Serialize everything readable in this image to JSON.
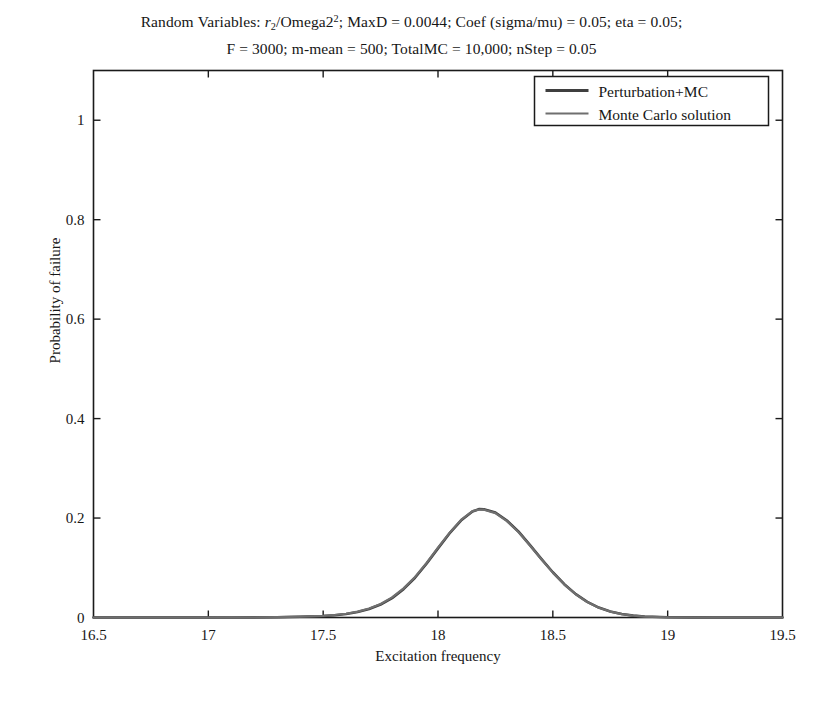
{
  "figure": {
    "background": "#ffffff",
    "title": {
      "line1_parts": [
        {
          "text": "Random Variables: ",
          "style": "normal"
        },
        {
          "text": "r",
          "style": "italic"
        },
        {
          "text": "2",
          "style": "sub"
        },
        {
          "text": "/Omega2",
          "style": "normal"
        },
        {
          "text": "2",
          "style": "sup"
        },
        {
          "text": "; MaxD = 0.0044; Coef (sigma/mu) = 0.05; eta = 0.05;",
          "style": "normal"
        }
      ],
      "line2": "F = 3000; m-mean = 500; TotalMC = 10,000; nStep = 0.05",
      "line1_plain": "Random Variables: r2/Omega2^2; MaxD = 0.0044; Coef (sigma/mu) = 0.05; eta = 0.05;"
    }
  },
  "chart_data": {
    "type": "line",
    "xlabel": "Excitation frequency",
    "ylabel": "Probability of failure",
    "xlim": [
      16.5,
      19.5
    ],
    "ylim": [
      0,
      1.1
    ],
    "xticks": [
      16.5,
      17,
      17.5,
      18,
      18.5,
      19,
      19.5
    ],
    "xticklabels": [
      "16.5",
      "17",
      "17.5",
      "18",
      "18.5",
      "19",
      "19.5"
    ],
    "yticks": [
      0,
      0.2,
      0.4,
      0.6,
      0.8,
      1
    ],
    "yticklabels": [
      "0",
      "0.2",
      "0.4",
      "0.6",
      "0.8",
      "1"
    ],
    "grid": false,
    "legend_position": "upper right",
    "peak": {
      "x": 18.18,
      "y": 0.218
    },
    "x": [
      16.5,
      16.6,
      16.7,
      16.8,
      16.9,
      17.0,
      17.1,
      17.2,
      17.3,
      17.4,
      17.5,
      17.55,
      17.6,
      17.65,
      17.7,
      17.75,
      17.8,
      17.85,
      17.9,
      17.95,
      18.0,
      18.05,
      18.1,
      18.15,
      18.18,
      18.2,
      18.25,
      18.3,
      18.35,
      18.4,
      18.45,
      18.5,
      18.55,
      18.6,
      18.65,
      18.7,
      18.75,
      18.8,
      18.85,
      18.9,
      19.0,
      19.1,
      19.2,
      19.3,
      19.4,
      19.5
    ],
    "series": [
      {
        "name": "Perturbation+MC",
        "color": "#3f3f3f",
        "linewidth": 2.6,
        "values": [
          0.0,
          0.0,
          0.0,
          0.0,
          0.0,
          0.0,
          0.0,
          0.0002,
          0.0006,
          0.0014,
          0.003,
          0.0045,
          0.007,
          0.011,
          0.017,
          0.026,
          0.039,
          0.057,
          0.08,
          0.108,
          0.139,
          0.169,
          0.195,
          0.213,
          0.218,
          0.2175,
          0.211,
          0.195,
          0.173,
          0.146,
          0.118,
          0.091,
          0.067,
          0.047,
          0.0315,
          0.02,
          0.0122,
          0.007,
          0.0038,
          0.002,
          0.0006,
          0.0002,
          0.0,
          0.0,
          0.0,
          0.0
        ]
      },
      {
        "name": "Monte Carlo solution",
        "color": "#6f6f6f",
        "linewidth": 2.2,
        "values": [
          0.0,
          0.0,
          0.0,
          0.0,
          0.0,
          0.0,
          0.0001,
          0.0003,
          0.0008,
          0.0017,
          0.0034,
          0.005,
          0.0076,
          0.0118,
          0.018,
          0.0272,
          0.0404,
          0.0586,
          0.0816,
          0.1096,
          0.1404,
          0.1702,
          0.1962,
          0.214,
          0.2172,
          0.2168,
          0.2098,
          0.1938,
          0.1718,
          0.1448,
          0.117,
          0.0902,
          0.0662,
          0.0464,
          0.031,
          0.0196,
          0.0119,
          0.0068,
          0.0036,
          0.0019,
          0.0005,
          0.0001,
          0.0,
          0.0,
          0.0,
          0.0
        ]
      }
    ]
  },
  "legend": {
    "items": [
      {
        "label": "Perturbation+MC",
        "color": "#3f3f3f"
      },
      {
        "label": "Monte Carlo solution",
        "color": "#6f6f6f"
      }
    ]
  },
  "axes": {
    "frame_color": "#1a1a1a",
    "x_label": "Excitation frequency",
    "y_label": "Probability of failure"
  }
}
